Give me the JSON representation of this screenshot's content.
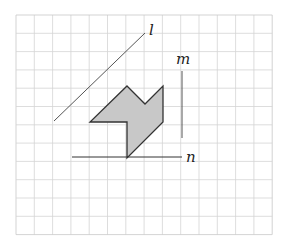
{
  "figure": {
    "width": 286,
    "height": 242,
    "grid": {
      "x0": 16,
      "y0": 15,
      "cols": 14,
      "rows": 12,
      "cell": 18.3,
      "line_color": "#d4d4d4",
      "border_color": "#c8c8c8"
    },
    "shape": {
      "name": "shaded-polygon",
      "points": [
        [
          127,
          86
        ],
        [
          145,
          104
        ],
        [
          163,
          86
        ],
        [
          163,
          122
        ],
        [
          127,
          158
        ],
        [
          127,
          122
        ],
        [
          90,
          122
        ]
      ],
      "fill": "#c8c8c8",
      "stroke": "#333333"
    },
    "lines": [
      {
        "id": "l",
        "label": "l",
        "x1": 54,
        "y1": 121,
        "x2": 145,
        "y2": 33,
        "label_x": 149,
        "label_y": 35,
        "color": "#555555"
      },
      {
        "id": "m",
        "label": "m",
        "x1": 182,
        "y1": 71,
        "x2": 182,
        "y2": 138,
        "label_x": 176,
        "label_y": 64,
        "color": "#555555"
      },
      {
        "id": "n",
        "label": "n",
        "x1": 72,
        "y1": 157,
        "x2": 182,
        "y2": 157,
        "label_x": 186,
        "label_y": 162,
        "color": "#333333"
      }
    ]
  }
}
